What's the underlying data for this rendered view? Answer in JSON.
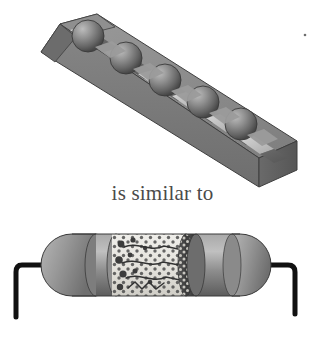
{
  "figure": {
    "caption": "is similar to",
    "top_panel": {
      "name": "corrugated-block-with-balls",
      "description": "Isometric corrugated (washboard) block with five spheres resting in its grooves",
      "ball_count": 5,
      "groove_count": 6
    },
    "bottom_panel": {
      "name": "cutaway-resistor",
      "description": "Cutaway axial resistor with two lead wires bent downward, gray casing and speckled composite interior",
      "lead_count": 2
    },
    "colors": {
      "background": "#ffffff",
      "caption_text": "#4a4a4a",
      "block_top_face": "#8e8e8e",
      "block_front_face": "#7a7a7a",
      "block_side_face": "#5f5f5f",
      "groove_highlight": "#c9c9c9",
      "groove_shadow": "#4f4f4f",
      "ball_light": "#b0b0b0",
      "ball_mid": "#7c7c7c",
      "ball_dark": "#4a4a4a",
      "outline": "#3a3a3a",
      "resistor_casing_light": "#b4b4b4",
      "resistor_casing_mid": "#8a8a8a",
      "resistor_casing_dark": "#5a5a5a",
      "resistor_interior": "#e8e6e2",
      "resistor_speckle": "#4d4d4d",
      "resistor_band_dark": "#3f3f3f",
      "lead_wire": "#111111"
    },
    "speck_mark": {
      "name": "stray-speck",
      "x": 305,
      "y": 35
    }
  }
}
